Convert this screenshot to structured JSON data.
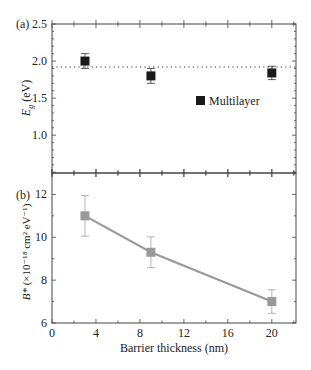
{
  "chart_data": [
    {
      "panel_label": "(a)",
      "type": "scatter",
      "title": "",
      "xlabel": "Barrier thickness (nm)",
      "ylabel_main": "E",
      "ylabel_sub": "g",
      "ylabel_unit": " (eV)",
      "xlim": [
        0,
        22.2
      ],
      "ylim": [
        0.49,
        2.5
      ],
      "yticks": [
        1.0,
        1.5,
        2.0,
        2.5
      ],
      "ytick_labels": [
        "1.0",
        "1.5",
        "2.0",
        "2.5"
      ],
      "grid": false,
      "legend_position": "center-right",
      "series": [
        {
          "name": "Multilayer",
          "marker": "square",
          "color": "#1a1a1a",
          "x": [
            3,
            9,
            20
          ],
          "y": [
            2.0,
            1.8,
            1.84
          ],
          "yerr": [
            0.1,
            0.1,
            0.09
          ]
        }
      ],
      "reference_line": {
        "style": "dotted",
        "y": 1.92,
        "color": "#333333"
      }
    },
    {
      "panel_label": "(b)",
      "type": "line",
      "title": "",
      "xlabel": "Barrier thickness (nm)",
      "ylabel_main": "B*",
      "ylabel_unit": " (×10⁻¹⁸ cm² eV⁻¹)",
      "xlim": [
        0,
        22.2
      ],
      "ylim": [
        6,
        13
      ],
      "xticks": [
        0,
        4,
        8,
        12,
        16,
        20
      ],
      "xtick_labels": [
        "0",
        "4",
        "8",
        "12",
        "16",
        "20"
      ],
      "yticks": [
        6,
        8,
        10,
        12
      ],
      "ytick_labels": [
        "6",
        "8",
        "10",
        "12"
      ],
      "grid": false,
      "series": [
        {
          "name": "B*",
          "marker": "square",
          "color": "#999999",
          "x": [
            3,
            9,
            20
          ],
          "y": [
            11.0,
            9.3,
            7.0
          ],
          "yerr": [
            0.95,
            0.72,
            0.55
          ]
        }
      ]
    }
  ],
  "legend": {
    "label": "Multilayer"
  },
  "axis": {
    "xlabel": "Barrier thickness (nm)"
  }
}
